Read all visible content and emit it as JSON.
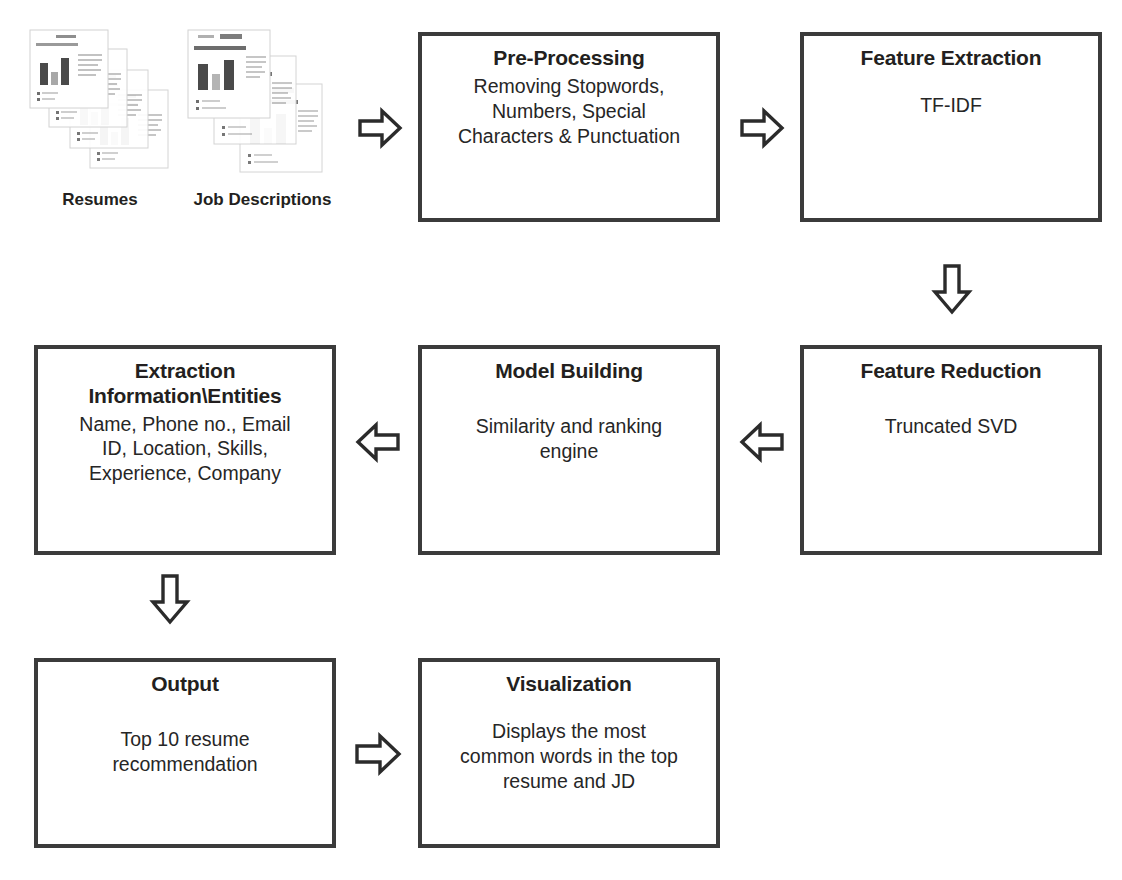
{
  "diagram": {
    "colors": {
      "box_border": "#3b3b3b",
      "arrow_stroke": "#2b2b2b",
      "arrow_fill": "#ffffff",
      "text": "#231f20",
      "background": "#ffffff"
    }
  },
  "sources": [
    {
      "id": "resumes",
      "label": "Resumes",
      "icon": "document-stack-icon",
      "sheets": 4
    },
    {
      "id": "job-descriptions",
      "label": "Job Descriptions",
      "icon": "document-stack-icon",
      "sheets": 3
    }
  ],
  "nodes": [
    {
      "id": "pre-processing",
      "title": "Pre-Processing",
      "body": "Removing Stopwords,\nNumbers, Special\nCharacters & Punctuation",
      "spacing": "tight"
    },
    {
      "id": "feature-extraction",
      "title": "Feature Extraction",
      "body": "TF-IDF",
      "spacing": "medium"
    },
    {
      "id": "feature-reduction",
      "title": "Feature Reduction",
      "body": "Truncated SVD",
      "spacing": "medium"
    },
    {
      "id": "model-building",
      "title": "Model Building",
      "body": "Similarity and ranking\nengine",
      "spacing": "medium"
    },
    {
      "id": "extraction-information-entities",
      "title": "Extraction\nInformation\\Entities",
      "body": "Name, Phone no., Email\nID, Location, Skills,\nExperience, Company",
      "spacing": "tight"
    },
    {
      "id": "output",
      "title": "Output",
      "body": "Top 10 resume\nrecommendation",
      "spacing": "medium"
    },
    {
      "id": "visualization",
      "title": "Visualization",
      "body": "Displays the most\ncommon words in the top\nresume and JD",
      "spacing": "medium"
    }
  ],
  "connectors": [
    {
      "id": "sources-to-preprocessing",
      "direction": "right",
      "icon": "arrow-right-icon",
      "from": "job-descriptions",
      "to": "pre-processing"
    },
    {
      "id": "preprocessing-to-feature-extraction",
      "direction": "right",
      "icon": "arrow-right-icon",
      "from": "pre-processing",
      "to": "feature-extraction"
    },
    {
      "id": "feature-extraction-to-feature-reduction",
      "direction": "down",
      "icon": "arrow-down-icon",
      "from": "feature-extraction",
      "to": "feature-reduction"
    },
    {
      "id": "feature-reduction-to-model-building",
      "direction": "left",
      "icon": "arrow-left-icon",
      "from": "feature-reduction",
      "to": "model-building"
    },
    {
      "id": "model-building-to-extraction",
      "direction": "left",
      "icon": "arrow-left-icon",
      "from": "model-building",
      "to": "extraction-information-entities"
    },
    {
      "id": "extraction-to-output",
      "direction": "down",
      "icon": "arrow-down-icon",
      "from": "extraction-information-entities",
      "to": "output"
    },
    {
      "id": "output-to-visualization",
      "direction": "right",
      "icon": "arrow-right-icon",
      "from": "output",
      "to": "visualization"
    }
  ]
}
